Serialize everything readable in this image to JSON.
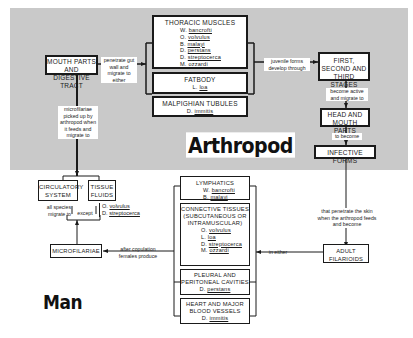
{
  "regions": {
    "arthropod": {
      "title": "Arthropod",
      "background": "#c9c9c9"
    },
    "man": {
      "title": "Man"
    }
  },
  "arthropod_nodes": {
    "mouth_parts": "MOUTH PARTS AND DIGESTIVE TRACT",
    "thoracic_muscles": {
      "title": "THORACIC MUSCLES",
      "species": [
        {
          "genus": "W.",
          "name": "bancrofti"
        },
        {
          "genus": "O.",
          "name": "volvulus"
        },
        {
          "genus": "B.",
          "name": "malayi"
        },
        {
          "genus": "D.",
          "name": "perstans"
        },
        {
          "genus": "D.",
          "name": "streptocerca"
        },
        {
          "genus": "M.",
          "name": "ozzardi"
        }
      ]
    },
    "fatbody": {
      "title": "FATBODY",
      "species": [
        {
          "genus": "L.",
          "name": "loa"
        }
      ]
    },
    "malpighian": {
      "title": "MALPIGHIAN TUBULES",
      "species": [
        {
          "genus": "D.",
          "name": "immitis"
        }
      ]
    },
    "stages": "FIRST, SECOND AND THIRD STAGES",
    "head_mouth": "HEAD AND MOUTH PARTS",
    "infective": "INFECTIVE FORMS"
  },
  "arthropod_edges": {
    "penetrate": "penetrate gut wall and migrate to either",
    "juvenile": "juvenile forms develop through",
    "become_active": "become active and migrate to",
    "to_become": "to become",
    "microfilariae_picked": "microfilariae picked up by arthropod when it feeds and migrate to"
  },
  "man_nodes": {
    "circulatory": "CIRCULATORY SYSTEM",
    "tissue_fluids": "TISSUE FLUIDS",
    "tissue_except": [
      {
        "genus": "O.",
        "name": "volvulus"
      },
      {
        "genus": "D.",
        "name": "streptocerca"
      }
    ],
    "microfilariae": "MICROFILARIAE",
    "lymphatics": {
      "title": "LYMPHATICS",
      "species": [
        {
          "genus": "W.",
          "name": "bancrofti"
        },
        {
          "genus": "B.",
          "name": "malayi"
        }
      ]
    },
    "connective": {
      "title": "CONNECTIVE TISSUES (SUBCUTANEOUS OR INTRAMUSCULAR)",
      "species": [
        {
          "genus": "O.",
          "name": "volvulus"
        },
        {
          "genus": "L.",
          "name": "loa"
        },
        {
          "genus": "D.",
          "name": "streptocerca"
        },
        {
          "genus": "M.",
          "name": "ozzardi"
        }
      ]
    },
    "pleural": {
      "title": "PLEURAL AND PERITONEAL CAVITIES",
      "species": [
        {
          "genus": "D.",
          "name": "perstans"
        }
      ]
    },
    "heart": {
      "title": "HEART AND MAJOR BLOOD VESSELS",
      "species": [
        {
          "genus": "D.",
          "name": "immitis"
        }
      ]
    },
    "adult": "ADULT FILARIOIDS"
  },
  "man_edges": {
    "all_species": "all species migrate to",
    "except": "except",
    "after_copulation": "after copulation females produce",
    "in_either": "in either",
    "penetrate_skin": "that penetrate the skin when the arthropod feeds and become"
  }
}
